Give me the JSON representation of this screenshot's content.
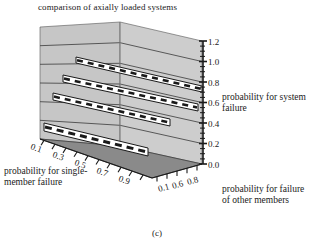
{
  "chart_data": {
    "type": "line",
    "title": "comparison of axially loaded systems",
    "caption": "(c)",
    "xlabel": "probability for single-member failure",
    "ylabel": "probability for failure of other members",
    "zlabel": "probability for system failure",
    "projection": "3d-surface",
    "zlim": [
      0.0,
      1.2
    ],
    "z_ticks": [
      "0.0",
      "0.2",
      "0.4",
      "0.6",
      "0.8",
      "1.0",
      "1.2"
    ],
    "x_ticks": [
      "0.1",
      "0.3",
      "0.5",
      "0.7",
      "0.9"
    ],
    "y_ticks": [
      "0.1",
      "0.6",
      "0.8"
    ],
    "grid": true,
    "legend": "none",
    "series": [
      {
        "name": "ribbon-1",
        "y": 0.8,
        "values": [
          1.0,
          1.0,
          1.0,
          1.0,
          1.0,
          1.0,
          1.0,
          1.0,
          1.0
        ]
      },
      {
        "name": "ribbon-2",
        "y": 0.6,
        "values": [
          0.82,
          0.82,
          0.82,
          0.82,
          0.82,
          0.82,
          0.82,
          0.82,
          0.82
        ]
      },
      {
        "name": "ribbon-3",
        "y": 0.4,
        "values": [
          0.6,
          0.6,
          0.6,
          0.6,
          0.6,
          0.6,
          0.6,
          0.6,
          0.6
        ]
      },
      {
        "name": "ribbon-4",
        "y": 0.1,
        "values": [
          0.05,
          0.05,
          0.05,
          0.05,
          0.05,
          0.05,
          0.05,
          0.05,
          0.05
        ]
      }
    ],
    "colors": {
      "wall": "#c9c9c9",
      "wall_side": "#bdbdbd",
      "floor": "#8a8a8a",
      "ribbon_fill": "#ffffff",
      "line": "#1a1a1a",
      "text": "#1a1a1a"
    }
  }
}
